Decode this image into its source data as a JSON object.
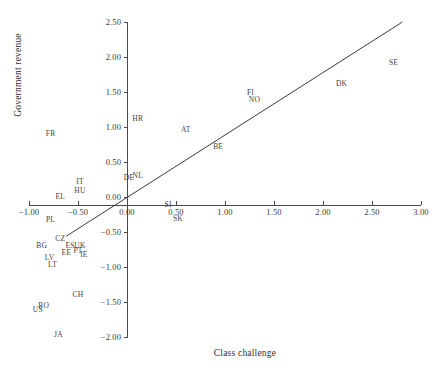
{
  "chart_data": {
    "type": "scatter",
    "title": "",
    "xlabel": "Class challenge",
    "ylabel": "Government revenue",
    "xlim": [
      -1.0,
      3.0
    ],
    "ylim": [
      -2.0,
      2.5
    ],
    "grid": false,
    "legend": "none",
    "xticks": [
      "-1.00",
      "-0.50",
      "0.00",
      "0.50",
      "1.00",
      "1.50",
      "2.00",
      "2.50",
      "3.00"
    ],
    "xtick_values": [
      -1.0,
      -0.5,
      0.0,
      0.5,
      1.0,
      1.5,
      2.0,
      2.5,
      3.0
    ],
    "yticks": [
      "2.50",
      "2.00",
      "1.50",
      "1.00",
      "0.50",
      "0.00",
      "-0.50",
      "-1.00",
      "-1.50",
      "-2.00"
    ],
    "ytick_values": [
      2.5,
      2.0,
      1.5,
      1.0,
      0.5,
      0.0,
      -0.5,
      -1.0,
      -1.5,
      -2.0
    ],
    "point_label_field": "country_code",
    "points": [
      {
        "country_code": "SE",
        "x": 2.72,
        "y": 1.93
      },
      {
        "country_code": "DK",
        "x": 2.19,
        "y": 1.63
      },
      {
        "country_code": "FI",
        "x": 1.26,
        "y": 1.5
      },
      {
        "country_code": "NO",
        "x": 1.3,
        "y": 1.4
      },
      {
        "country_code": "HR",
        "x": 0.11,
        "y": 1.13
      },
      {
        "country_code": "AT",
        "x": 0.6,
        "y": 0.97
      },
      {
        "country_code": "FR",
        "x": -0.78,
        "y": 0.92
      },
      {
        "country_code": "BE",
        "x": 0.93,
        "y": 0.73
      },
      {
        "country_code": "NL",
        "x": 0.11,
        "y": 0.32
      },
      {
        "country_code": "DE",
        "x": 0.02,
        "y": 0.29
      },
      {
        "country_code": "IT",
        "x": -0.48,
        "y": 0.23
      },
      {
        "country_code": "HU",
        "x": -0.48,
        "y": 0.1
      },
      {
        "country_code": "EL",
        "x": -0.68,
        "y": 0.01
      },
      {
        "country_code": "SI",
        "x": 0.42,
        "y": -0.1
      },
      {
        "country_code": "SK",
        "x": 0.52,
        "y": -0.3
      },
      {
        "country_code": "PL",
        "x": -0.78,
        "y": -0.32
      },
      {
        "country_code": "CZ",
        "x": -0.68,
        "y": -0.58
      },
      {
        "country_code": "BG",
        "x": -0.87,
        "y": -0.68
      },
      {
        "country_code": "ES",
        "x": -0.58,
        "y": -0.68
      },
      {
        "country_code": "UK",
        "x": -0.48,
        "y": -0.68
      },
      {
        "country_code": "PT",
        "x": -0.5,
        "y": -0.76
      },
      {
        "country_code": "EE",
        "x": -0.62,
        "y": -0.78
      },
      {
        "country_code": "IE",
        "x": -0.44,
        "y": -0.82
      },
      {
        "country_code": "LV",
        "x": -0.79,
        "y": -0.86
      },
      {
        "country_code": "LT",
        "x": -0.76,
        "y": -0.95
      },
      {
        "country_code": "CH",
        "x": -0.5,
        "y": -1.38
      },
      {
        "country_code": "RO",
        "x": -0.85,
        "y": -1.54
      },
      {
        "country_code": "US",
        "x": -0.91,
        "y": -1.6
      },
      {
        "country_code": "JA",
        "x": -0.7,
        "y": -1.95
      }
    ],
    "trendline": {
      "type": "line",
      "x_start": -0.62,
      "y_start": -0.56,
      "x_end": 2.81,
      "y_end": 2.5,
      "color": "#3a3a3a"
    }
  },
  "axis": {
    "x_title": "Class challenge",
    "y_title": "Government revenue"
  }
}
